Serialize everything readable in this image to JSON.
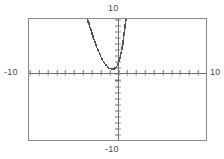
{
  "screen": {
    "kind": "graphing-calculator-plot",
    "background_color": "#ffffff",
    "frame_color": "#8a8a8a",
    "axis_color": "#6e6e6e",
    "curve_color": "#555555"
  },
  "labels": {
    "ymax": "10",
    "ymin": "-10",
    "xmin": "-10",
    "xmax": "10"
  },
  "chart_data": {
    "type": "line",
    "title": "",
    "subtitle": "",
    "xlabel": "",
    "ylabel": "",
    "xlim": [
      -10,
      10
    ],
    "ylim": [
      -10,
      10
    ],
    "xtick_step": 1,
    "ytick_step": 1,
    "grid": false,
    "legend": false,
    "legend_position": "none",
    "axis_tick_labels_shown": false,
    "window_labels": {
      "top": "10",
      "bottom": "-10",
      "left": "-10",
      "right": "10"
    },
    "annotations": [],
    "series": [
      {
        "name": "y1",
        "style": "dotted-pixel-trace",
        "color": "#555555",
        "x": [
          -3.4,
          -3.25,
          -3.1,
          -2.95,
          -2.8,
          -2.65,
          -2.5,
          -2.35,
          -2.2,
          -2.05,
          -1.9,
          -1.75,
          -1.6,
          -1.45,
          -1.3,
          -1.15,
          -1.0,
          -0.85,
          -0.7,
          -0.55,
          -0.4,
          -0.25,
          -0.1,
          0.0,
          0.08,
          0.16,
          0.24,
          0.32,
          0.4,
          0.48,
          0.56,
          0.62,
          0.68,
          0.74,
          0.8,
          0.86,
          0.92,
          0.97
        ],
        "y": [
          10.0,
          9.3,
          8.6,
          7.9,
          7.25,
          6.6,
          6.0,
          5.4,
          4.85,
          4.35,
          3.85,
          3.4,
          3.0,
          2.65,
          2.35,
          2.1,
          1.92,
          1.8,
          1.74,
          1.72,
          1.78,
          1.9,
          2.1,
          2.3,
          2.6,
          2.95,
          3.35,
          3.8,
          4.35,
          4.95,
          5.6,
          6.2,
          6.85,
          7.5,
          8.2,
          8.9,
          9.55,
          10.0
        ]
      }
    ]
  }
}
